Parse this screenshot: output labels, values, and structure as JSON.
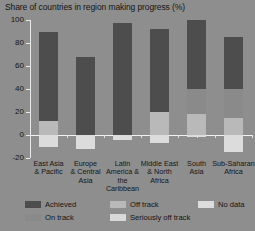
{
  "chart": {
    "title": "Share of countries in region making progress (%)"
  },
  "chart_data": {
    "type": "bar",
    "subtype": "stacked-bar-with-negative",
    "title": "Share of countries in region making progress (%)",
    "xlabel": "",
    "ylabel": "",
    "ylim": [
      -20,
      100
    ],
    "yticks": [
      100,
      80,
      60,
      40,
      20,
      0,
      -20
    ],
    "ytick_labels": [
      "100",
      "80",
      "60",
      "40",
      "20",
      "0",
      "-20"
    ],
    "grid": false,
    "legend_position": "bottom",
    "categories": [
      "East Asia & Pacific",
      "Europe & Central Asia",
      "Latin America & the Caribbean",
      "Middle East & North Africa",
      "South Asia",
      "Sub-Saharan Africa"
    ],
    "category_lines": [
      [
        "East Asia",
        "& Pacific"
      ],
      [
        "Europe",
        "& Central",
        "Asia"
      ],
      [
        "Latin",
        "America &",
        "the Caribbean"
      ],
      [
        "Middle East",
        "& North",
        "Africa"
      ],
      [
        "South",
        "Asia"
      ],
      [
        "Sub-Saharan",
        "Africa"
      ]
    ],
    "series": [
      {
        "name": "Achieved",
        "color": "#4d4d4d",
        "values": [
          78,
          68,
          97,
          72,
          60,
          45
        ]
      },
      {
        "name": "On track",
        "color": "#8a8a8a",
        "values": [
          0,
          0,
          0,
          0,
          22,
          25
        ]
      },
      {
        "name": "Off track",
        "color": "#b9b9b9",
        "values": [
          12,
          0,
          0,
          20,
          18,
          15
        ]
      },
      {
        "name": "Seriously off track",
        "color": "#d9d9d9",
        "values": [
          0,
          0,
          0,
          0,
          0,
          0
        ]
      },
      {
        "name": "No data",
        "color": "#dcdcdc",
        "values": [
          -10,
          -12,
          -4,
          -7,
          -2,
          -15
        ]
      }
    ]
  },
  "legend": {
    "items": [
      {
        "label": "Achieved",
        "color": "#4d4d4d"
      },
      {
        "label": "On track",
        "color": "#8a8a8a"
      },
      {
        "label": "Off track",
        "color": "#b9b9b9"
      },
      {
        "label": "Seriously off track",
        "color": "#d9d9d9"
      },
      {
        "label": "No data",
        "color": "#dcdcdc"
      }
    ]
  }
}
